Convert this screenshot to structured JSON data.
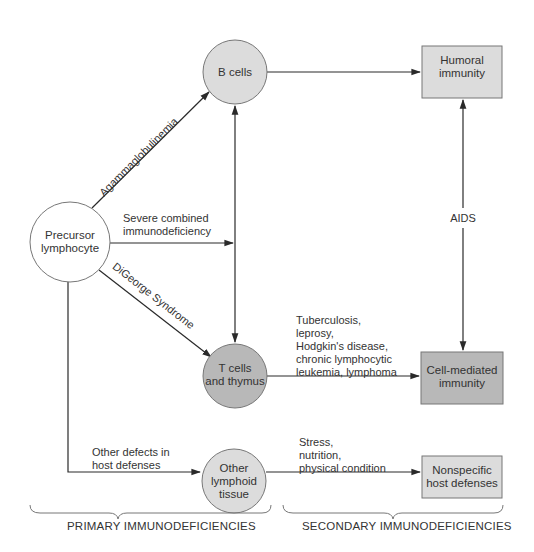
{
  "nodes": {
    "precursor": {
      "label_line1": "Precursor",
      "label_line2": "lymphocyte",
      "shape": "circle",
      "fill": "#ffffff"
    },
    "b_cells": {
      "label": "B cells",
      "shape": "circle",
      "fill": "#dcdcdc"
    },
    "t_cells": {
      "label_line1": "T cells",
      "label_line2": "and thymus",
      "shape": "circle",
      "fill": "#b8b8b8"
    },
    "other_lymphoid": {
      "label_line1": "Other",
      "label_line2": "lymphoid",
      "label_line3": "tissue",
      "shape": "circle",
      "fill": "#dcdcdc"
    },
    "humoral": {
      "label_line1": "Humoral",
      "label_line2": "immunity",
      "shape": "box",
      "fill": "#dcdcdc"
    },
    "cell_mediated": {
      "label_line1": "Cell-mediated",
      "label_line2": "immunity",
      "shape": "box",
      "fill": "#b8b8b8"
    },
    "nonspecific": {
      "label_line1": "Nonspecific",
      "label_line2": "host defenses",
      "shape": "box",
      "fill": "#dcdcdc"
    }
  },
  "edges": {
    "agammaglobulinemia": {
      "label": "Agammaglobulinemia",
      "from": "precursor",
      "to": "b_cells"
    },
    "scid": {
      "label_line1": "Severe combined",
      "label_line2": "immunodeficiency",
      "from": "precursor",
      "to": "b_t_axis"
    },
    "digeorge": {
      "label": "DiGeorge Syndrome",
      "from": "precursor",
      "to": "t_cells"
    },
    "other_defects": {
      "label_line1": "Other defects in",
      "label_line2": "host defenses",
      "from": "precursor",
      "to": "other_lymphoid"
    },
    "b_to_humoral": {
      "from": "b_cells",
      "to": "humoral"
    },
    "b_t_bidirectional": {
      "from": "b_cells",
      "to": "t_cells"
    },
    "aids": {
      "label": "AIDS",
      "from": "humoral",
      "to": "cell_mediated"
    },
    "t_to_cell_mediated": {
      "label_lines": [
        "Tuberculosis,",
        "leprosy,",
        "Hodgkin's disease,",
        "chronic lymphocytic",
        "leukemia, lymphoma"
      ],
      "from": "t_cells",
      "to": "cell_mediated"
    },
    "other_to_nonspecific": {
      "label_lines": [
        "Stress,",
        "nutrition,",
        "physical condition"
      ],
      "from": "other_lymphoid",
      "to": "nonspecific"
    }
  },
  "groups": {
    "primary": "PRIMARY IMMUNODEFICIENCIES",
    "secondary": "SECONDARY IMMUNODEFICIENCIES"
  },
  "colors": {
    "line": "#2a2a2a",
    "light_fill": "#dcdcdc",
    "dark_fill": "#b8b8b8",
    "border": "#777777"
  }
}
